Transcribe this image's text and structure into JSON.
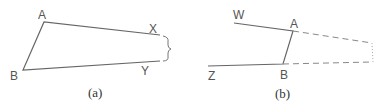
{
  "figure_a": {
    "caption": "(a)",
    "labels": {
      "A": "A",
      "B": "B",
      "X": "X",
      "Y": "Y"
    },
    "points": {
      "A": [
        44,
        22
      ],
      "B": [
        23,
        70
      ],
      "X": [
        160,
        35
      ],
      "Y": [
        160,
        61
      ]
    }
  },
  "figure_b": {
    "caption": "(b)",
    "labels": {
      "W": "W",
      "A": "A",
      "B": "B",
      "Z": "Z"
    },
    "points": {
      "W": [
        234,
        23
      ],
      "A": [
        293,
        31
      ],
      "B": [
        283,
        64
      ],
      "Z": [
        208,
        66
      ],
      "DashEndTop": [
        372,
        43
      ],
      "DashEndBottom": [
        372,
        62
      ]
    }
  },
  "colors": {
    "line": "#666666",
    "text": "#555555"
  }
}
